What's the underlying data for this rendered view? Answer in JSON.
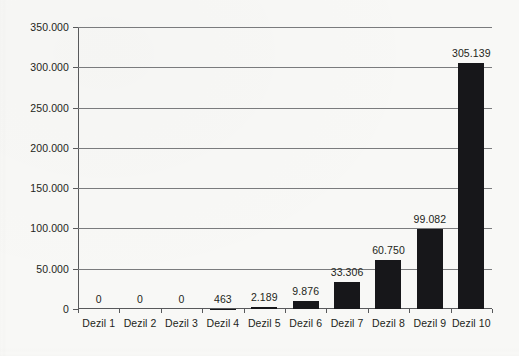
{
  "chart_data": {
    "type": "bar",
    "title": "",
    "subtitle": "",
    "xlabel": "",
    "ylabel": "",
    "categories": [
      "Dezil 1",
      "Dezil 2",
      "Dezil 3",
      "Dezil 4",
      "Dezil 5",
      "Dezil 6",
      "Dezil 7",
      "Dezil 8",
      "Dezil 9",
      "Dezil 10"
    ],
    "values": [
      0,
      0,
      0,
      463,
      2189,
      9876,
      33306,
      60750,
      99082,
      305139
    ],
    "value_labels": [
      "0",
      "0",
      "0",
      "463",
      "2.189",
      "9.876",
      "33.306",
      "60.750",
      "99.082",
      "305.139"
    ],
    "ylim": [
      0,
      350000
    ],
    "yticks": [
      0,
      50000,
      100000,
      150000,
      200000,
      250000,
      300000,
      350000
    ],
    "ytick_labels": [
      "0",
      "50.000",
      "100.000",
      "150.000",
      "200.000",
      "250.000",
      "300.000",
      "350.000"
    ],
    "grid": true,
    "legend": false,
    "legend_position": "none",
    "bar_color": "#17171a",
    "axis_color": "#58595b",
    "grid_color": "#7a7b7d",
    "background_color": "#f8f8f6",
    "text_color": "#231f20"
  }
}
